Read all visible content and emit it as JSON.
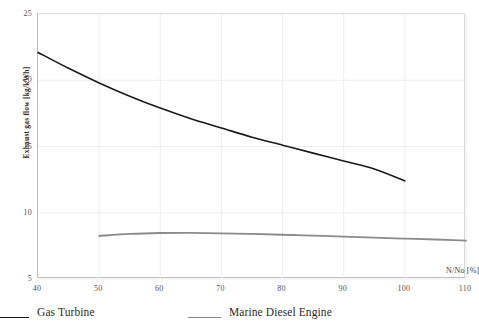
{
  "chart_data": {
    "type": "line",
    "title": "",
    "xlabel": "N/No  [%]",
    "ylabel": "Exhaust gas flow [kg/kWh]",
    "xlim": [
      40,
      110
    ],
    "ylim": [
      5,
      25
    ],
    "xticks": [
      40,
      50,
      60,
      70,
      80,
      90,
      100,
      110
    ],
    "yticks": [
      5,
      10,
      15,
      20,
      25
    ],
    "xtick_labels": [
      "40",
      "50",
      "60",
      "70",
      "80",
      "90",
      "100",
      "110"
    ],
    "ytick_labels": [
      "5",
      "10",
      "15",
      "20",
      "25"
    ],
    "grid": true,
    "legend_position": "bottom",
    "series": [
      {
        "name": "Gas Turbine",
        "color": "#1a1a1a",
        "width": 1.6,
        "x": [
          40,
          45,
          50,
          55,
          60,
          65,
          70,
          75,
          80,
          85,
          90,
          95,
          100
        ],
        "y": [
          22.1,
          20.9,
          19.8,
          18.8,
          17.9,
          17.1,
          16.4,
          15.7,
          15.1,
          14.5,
          13.9,
          13.3,
          12.4
        ]
      },
      {
        "name": "Marine Diesel Engine",
        "color": "#8a8a8a",
        "width": 1.8,
        "x": [
          50,
          55,
          60,
          65,
          70,
          75,
          80,
          85,
          90,
          95,
          100,
          105,
          110
        ],
        "y": [
          8.25,
          8.4,
          8.47,
          8.48,
          8.45,
          8.4,
          8.34,
          8.27,
          8.2,
          8.12,
          8.05,
          7.98,
          7.9
        ]
      }
    ]
  },
  "axis": {
    "y_title": "Exhaust gas flow [kg/kWh]",
    "x_title": "N/No  [%]"
  },
  "legend": {
    "entries": [
      {
        "label": "Gas Turbine",
        "color": "#1a1a1a"
      },
      {
        "label": "Marine Diesel Engine",
        "color": "#8a8a8a"
      }
    ]
  },
  "style": {
    "grid_color": "#ededed",
    "frame_color": "#c9c9c9",
    "background": "#ffffff",
    "tick_label_color": "#555555"
  }
}
